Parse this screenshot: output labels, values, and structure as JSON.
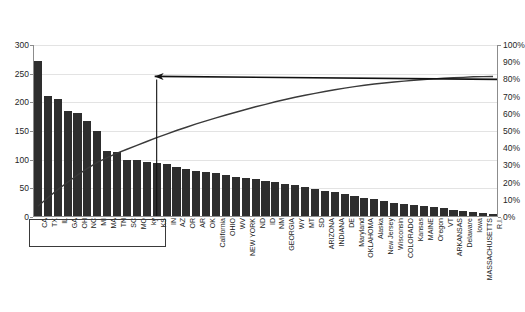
{
  "chart_data": {
    "type": "bar",
    "title": "",
    "subtitle": "",
    "xlabel": "",
    "ylabel": "",
    "y2label": "",
    "ylim": [
      0,
      300
    ],
    "y2lim": [
      0,
      1
    ],
    "grid": true,
    "legend_position": "none",
    "y_ticks": [
      0,
      50,
      100,
      150,
      200,
      250,
      300
    ],
    "y_tick_labels": [
      "0",
      "50",
      "100",
      "150",
      "200",
      "250",
      "300"
    ],
    "y2_ticks": [
      0,
      10,
      20,
      30,
      40,
      50,
      60,
      70,
      80,
      90,
      100
    ],
    "y2_tick_labels": [
      "0%",
      "10%",
      "20%",
      "30%",
      "40%",
      "50%",
      "60%",
      "70%",
      "80%",
      "90%",
      "100%"
    ],
    "categories": [
      "CA",
      "TX",
      "IL",
      "GA",
      "OH",
      "NC",
      "MI",
      "MA",
      "TN",
      "SC",
      "MO",
      "ky",
      "KS",
      "IN",
      "AZ",
      "OR",
      "AR",
      "OK",
      "California",
      "OHIO",
      "WV",
      "NEW YORK",
      "ND",
      "ID",
      "NM",
      "GEORGIA",
      "WY",
      "MT",
      "SD",
      "ARIZONA",
      "INDIANA",
      "DE",
      "Maryland",
      "OKLAHOMA",
      "Alaska",
      "New Jersey",
      "Wisconsin",
      "COLORADO",
      "Kansas",
      "MAINE",
      "Oregon",
      "VT",
      "ARKANSAS",
      "Delaware",
      "Iowa",
      "MASSACHUSETTS",
      "R.I."
    ],
    "series": [
      {
        "name": "Count",
        "axis": "left",
        "values": [
          272,
          211,
          205,
          185,
          182,
          168,
          150,
          116,
          113,
          100,
          99,
          96,
          95,
          92,
          88,
          84,
          80,
          78,
          76,
          73,
          70,
          68,
          66,
          63,
          61,
          58,
          55,
          52,
          49,
          46,
          43,
          40,
          37,
          34,
          31,
          28,
          25,
          23,
          21,
          19,
          17,
          15,
          13,
          11,
          9,
          7,
          5
        ]
      },
      {
        "name": "Cumulative %",
        "axis": "right",
        "values": [
          6.3,
          11.2,
          15.9,
          20.2,
          24.4,
          28.3,
          31.8,
          34.5,
          37.1,
          39.4,
          41.7,
          43.9,
          46.1,
          48.2,
          50.3,
          52.2,
          54.1,
          55.9,
          57.6,
          59.3,
          60.9,
          62.5,
          64.1,
          65.5,
          67.0,
          68.3,
          69.6,
          70.8,
          71.9,
          73.0,
          74.0,
          74.9,
          75.8,
          76.6,
          77.3,
          77.9,
          78.5,
          79.0,
          79.5,
          79.9,
          80.3,
          80.7,
          81.0,
          81.2,
          81.5,
          81.6,
          81.7
        ]
      }
    ],
    "annotations": [
      {
        "name": "cumulative-threshold-arrow",
        "type": "arrow",
        "label": "",
        "direction": "left",
        "y_value_percent": 80,
        "from_x_category_index": 46,
        "to_x_category_index": 12
      },
      {
        "name": "vital-few-dropline",
        "type": "vertical-line",
        "label": "",
        "x_category_index": 12,
        "y_from": 0,
        "y_to_percent": 80
      },
      {
        "name": "vital-few-label-box",
        "type": "rectangle",
        "label": "",
        "covers_categories_from": "CA",
        "covers_categories_to": "KS"
      }
    ],
    "colors": {
      "bar": "#2e2e2e",
      "line": "#3a3a3a",
      "annotation": "#111111",
      "gridline": "#e3e3e3",
      "axis": "#8c8c8c",
      "background": "#ffffff",
      "text": "#1a1a1a"
    }
  }
}
